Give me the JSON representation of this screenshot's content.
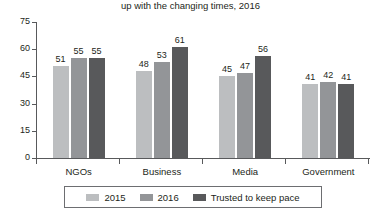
{
  "chart_data": {
    "type": "bar",
    "title": "up with the changing times, 2016",
    "xlabel": "",
    "ylabel": "",
    "ylim": [
      0,
      75
    ],
    "yticks": [
      0,
      15,
      30,
      45,
      60,
      75
    ],
    "grid": false,
    "legend_position": "bottom",
    "categories": [
      "NGOs",
      "Business",
      "Media",
      "Government"
    ],
    "series": [
      {
        "name": "2015",
        "color": "#bcbec0",
        "values": [
          51,
          48,
          45,
          41
        ]
      },
      {
        "name": "2016",
        "color": "#939598",
        "values": [
          55,
          53,
          47,
          42
        ]
      },
      {
        "name": "Trusted to keep pace",
        "color": "#58595b",
        "values": [
          55,
          61,
          56,
          41
        ]
      }
    ]
  }
}
